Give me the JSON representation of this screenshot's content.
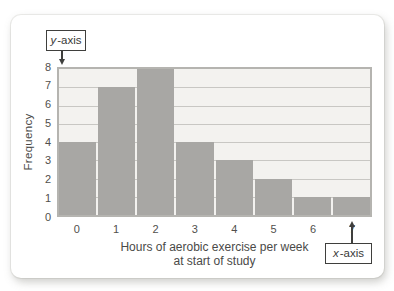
{
  "chart_data": {
    "type": "bar",
    "categories": [
      "0",
      "1",
      "2",
      "3",
      "4",
      "5",
      "6",
      "7"
    ],
    "values": [
      4,
      7,
      8,
      4,
      3,
      2,
      1,
      1
    ],
    "title": "",
    "xlabel_lines": [
      "Hours of aerobic exercise per week",
      "at start of study"
    ],
    "ylabel": "Frequency",
    "ylim": [
      0,
      8
    ],
    "yticks": [
      0,
      1,
      2,
      3,
      4,
      5,
      6,
      7,
      8
    ],
    "grid": true,
    "legend": "none"
  },
  "colors": {
    "bar": "#a8a7a4",
    "plot_bg": "#f3f2ef",
    "grid": "#c8c7c3",
    "plot_border": "#b5b4b0",
    "text": "#4a4a48"
  },
  "callouts": {
    "y_axis": {
      "letter": "y",
      "suffix": "-axis"
    },
    "x_axis": {
      "letter": "x",
      "suffix": "-axis"
    }
  }
}
